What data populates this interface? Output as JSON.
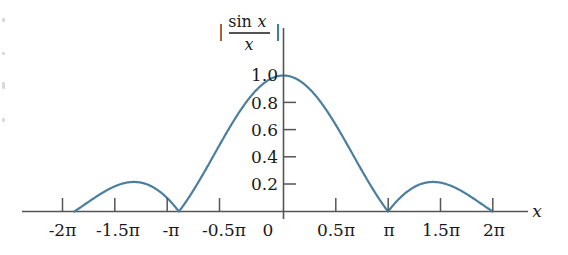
{
  "chart_data": {
    "type": "line",
    "title_parts": {
      "bar_left": "|",
      "numerator_fn": "sin",
      "numerator_var": "x",
      "denominator": "x",
      "bar_right": "|"
    },
    "xlabel": "x",
    "ylabel": "",
    "xlim": [
      -6.8,
      7.3
    ],
    "ylim": [
      0,
      1.12
    ],
    "grid": false,
    "legend": false,
    "line_color": "#4a7f9e",
    "axis_color": "#555555",
    "background": "#ffffff",
    "xtick_labels": [
      "-2π",
      "-1.5π",
      "-π",
      "-0.5π",
      "0",
      "0.5π",
      "π",
      "1.5π",
      "2π"
    ],
    "xtick_values": [
      -6.2832,
      -4.7124,
      -3.1416,
      -1.5708,
      0,
      1.5708,
      3.1416,
      4.7124,
      6.2832
    ],
    "ytick_labels": [
      "1.0",
      "0.8",
      "0.6",
      "0.4",
      "0.2"
    ],
    "ytick_values": [
      1.0,
      0.8,
      0.6,
      0.4,
      0.2
    ],
    "ytick_marks_drawn": [
      0.8,
      0.6,
      0.4,
      0.2
    ],
    "annotations": [
      "main lobe peak = 1.0 at x = 0",
      "zeros at x = ±π and x = ±2π",
      "side lobe peaks ≈ 0.217 near x = ±1.43π"
    ],
    "x": [
      -6.2832,
      -6.1087,
      -5.9341,
      -5.7596,
      -5.5851,
      -5.4105,
      -5.236,
      -5.0615,
      -4.8869,
      -4.7124,
      -4.5379,
      -4.3633,
      -4.1888,
      -4.0143,
      -3.8397,
      -3.6652,
      -3.4907,
      -3.3161,
      -3.1416,
      -2.9671,
      -2.7925,
      -2.618,
      -2.4435,
      -2.2689,
      -2.0944,
      -1.9199,
      -1.7453,
      -1.5708,
      -1.3963,
      -1.2217,
      -1.0472,
      -0.8727,
      -0.6981,
      -0.5236,
      -0.3491,
      -0.1745,
      0,
      0.1745,
      0.3491,
      0.5236,
      0.6981,
      0.8727,
      1.0472,
      1.2217,
      1.3963,
      1.5708,
      1.7453,
      1.9199,
      2.0944,
      2.2689,
      2.4435,
      2.618,
      2.7925,
      2.9671,
      3.1416,
      3.3161,
      3.4907,
      3.6652,
      3.8397,
      4.0143,
      4.1888,
      4.3633,
      4.5379,
      4.7124,
      4.8869,
      5.0615,
      5.236,
      5.4105,
      5.5851,
      5.7596,
      5.9341,
      6.1087,
      6.2832
    ],
    "y": [
      0,
      0.0285,
      0.0569,
      0.0845,
      0.111,
      0.1355,
      0.1575,
      0.1764,
      0.1917,
      0.2031,
      0.2102,
      0.2128,
      0.2109,
      0.2044,
      0.1935,
      0.1784,
      0.1594,
      0.137,
      0.1117,
      0.0841,
      0.0549,
      0.0248,
      0.0054,
      0.0359,
      0.0661,
      0.0955,
      0.1237,
      0.1501,
      0.1743,
      0.1958,
      0.2142,
      0.2293,
      0.2407,
      0.2482,
      0.2517,
      0.251,
      0.2461,
      0.251,
      0.2517,
      0.2482,
      0.2407,
      0.2293,
      0.2142,
      0.1958,
      0.1743,
      0.1501,
      0.1237,
      0.0955,
      0.0661,
      0.0359,
      0.0054,
      0.0248,
      0.0549,
      0.0841,
      0.1117,
      0.137,
      0.1594,
      0.1784,
      0.1935,
      0.2044,
      0.2109,
      0.2128,
      0.2102,
      0.2031,
      0.1917,
      0.1764,
      0.1575,
      0.1355,
      0.111,
      0.0845,
      0.0569,
      0.0285,
      0
    ]
  }
}
